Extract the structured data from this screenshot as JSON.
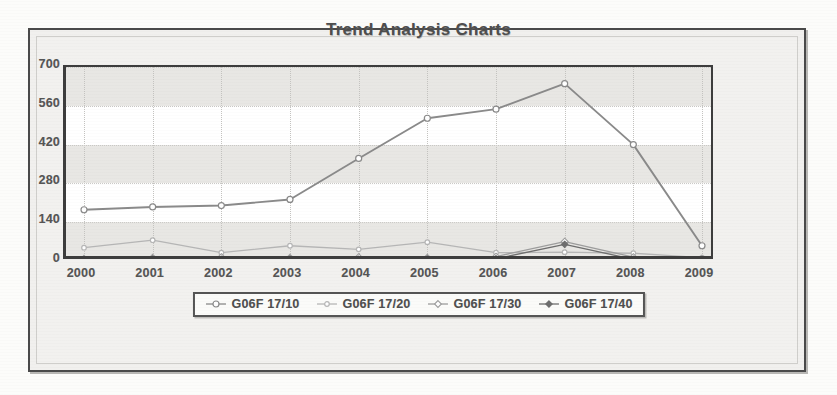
{
  "chart_data": {
    "type": "line",
    "title": "Trend Analysis Charts",
    "xlabel": "",
    "ylabel": "",
    "x": [
      2000,
      2001,
      2002,
      2003,
      2004,
      2005,
      2006,
      2007,
      2008,
      2009
    ],
    "categories": [
      "2000",
      "2001",
      "2002",
      "2003",
      "2004",
      "2005",
      "2006",
      "2007",
      "2008",
      "2009"
    ],
    "ylim": [
      0,
      700
    ],
    "yticks": [
      0,
      140,
      280,
      420,
      560,
      700
    ],
    "ytick_labels": [
      "0",
      "140",
      "280",
      "420",
      "560",
      "700"
    ],
    "grid": "horizontal-bands-and-dotted-vertical",
    "legend_position": "bottom",
    "series": [
      {
        "name": "G06F 17/10",
        "marker": "circle-open",
        "color": "#8a8a8a",
        "values": [
          185,
          195,
          200,
          222,
          370,
          515,
          548,
          640,
          420,
          55
        ]
      },
      {
        "name": "G06F 17/20",
        "marker": "circle-open-small",
        "color": "#b6b6b6",
        "values": [
          48,
          75,
          30,
          55,
          42,
          68,
          30,
          32,
          28,
          12
        ]
      },
      {
        "name": "G06F 17/30",
        "marker": "diamond-open",
        "color": "#9d9d9d",
        "values": [
          8,
          12,
          14,
          12,
          14,
          12,
          16,
          70,
          14,
          8
        ]
      },
      {
        "name": "G06F 17/40",
        "marker": "diamond-filled",
        "color": "#6e6e6e",
        "values": [
          5,
          6,
          6,
          6,
          6,
          6,
          8,
          60,
          6,
          5
        ]
      }
    ]
  },
  "legend": {
    "items": [
      {
        "label": "G06F 17/10",
        "marker": "legend-marker-circle-open"
      },
      {
        "label": "G06F 17/20",
        "marker": "legend-marker-circle-open-small"
      },
      {
        "label": "G06F 17/30",
        "marker": "legend-marker-diamond-open"
      },
      {
        "label": "G06F 17/40",
        "marker": "legend-marker-diamond-filled"
      }
    ]
  },
  "colors": {
    "series_1": "#8a8a8a",
    "series_2": "#b6b6b6",
    "series_3": "#9d9d9d",
    "series_4": "#6e6e6e",
    "axis": "#3d3d3d",
    "band": "#e8e7e4",
    "title_text": "#4e4e4e",
    "page": "#f1f0ee"
  }
}
